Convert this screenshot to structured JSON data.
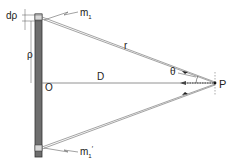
{
  "labels": {
    "drho": "dρ",
    "m1": "m",
    "m1_sub": "1",
    "rho": "ρ",
    "r": "r",
    "D": "D",
    "O": "O",
    "theta": "θ",
    "P": "P",
    "m1p": "m",
    "m1p_sub": "1",
    "m1p_prime": "′"
  }
}
